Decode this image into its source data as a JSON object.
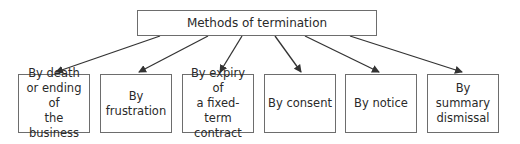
{
  "diagram": {
    "root": {
      "label": "Methods of termination"
    },
    "children": [
      {
        "label": "By death\nor ending of\nthe business"
      },
      {
        "label": "By\nfrustration"
      },
      {
        "label": "By expiry of\na fixed-term\ncontract"
      },
      {
        "label": "By consent"
      },
      {
        "label": "By notice"
      },
      {
        "label": "By\nsummary\ndismissal"
      }
    ],
    "colors": {
      "line": "#333333",
      "border": "#6d6d6d",
      "text": "#2a2a2a"
    }
  }
}
